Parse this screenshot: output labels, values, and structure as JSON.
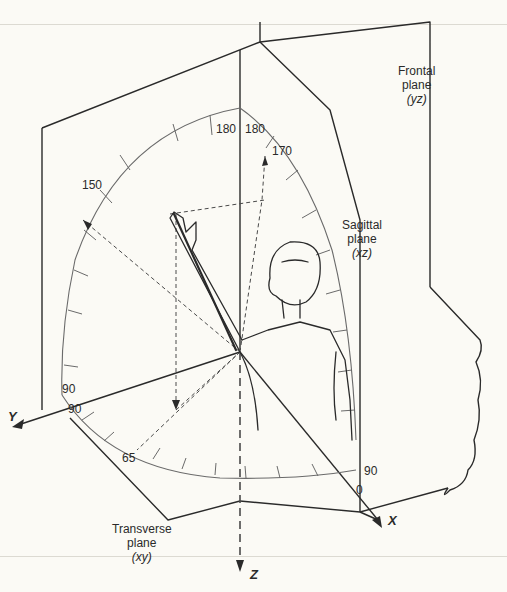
{
  "figure": {
    "colors": {
      "background": "#fbfaf5",
      "line": "#2a2a2a",
      "arc": "#6a6a6a",
      "dashed": "#4a4a4a"
    }
  },
  "planes": {
    "frontal": {
      "name": "Frontal",
      "word": "plane",
      "axes": "(yz)"
    },
    "sagittal": {
      "name": "Sagittal",
      "word": "plane",
      "axes": "(xz)"
    },
    "transverse": {
      "name": "Transverse",
      "word": "plane",
      "axes": "(xy)"
    }
  },
  "axes": {
    "x": "X",
    "y": "Y",
    "z": "Z"
  },
  "angles": {
    "frontal_top": "180",
    "sagittal_top": "180",
    "sagittal_170": "170",
    "frontal_150": "150",
    "frontal_90": "90",
    "transverse_90": "90",
    "transverse_65": "65",
    "transverse_90_right": "90",
    "transverse_0": "0"
  }
}
